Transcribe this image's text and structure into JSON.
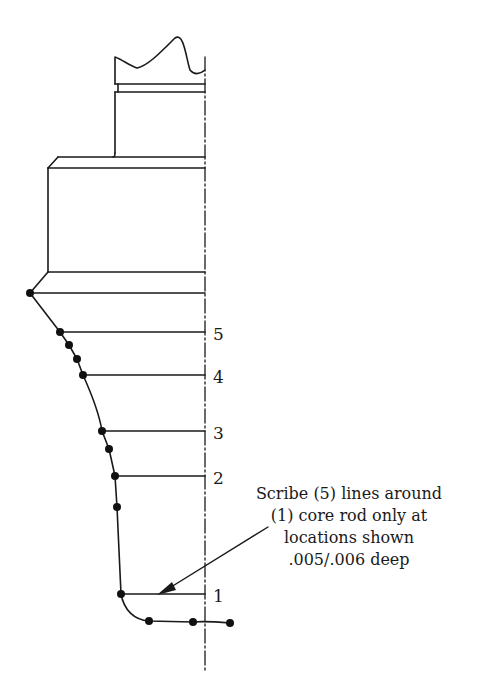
{
  "diagram": {
    "type": "technical-drawing",
    "colors": {
      "line": "#1a1a1a",
      "background": "#ffffff"
    },
    "scribe_labels": [
      "5",
      "4",
      "3",
      "2",
      "1"
    ],
    "annotation": {
      "lines": [
        "Scribe (5) lines around",
        "(1) core rod only at",
        "locations shown",
        ".005/.006 deep"
      ]
    }
  }
}
